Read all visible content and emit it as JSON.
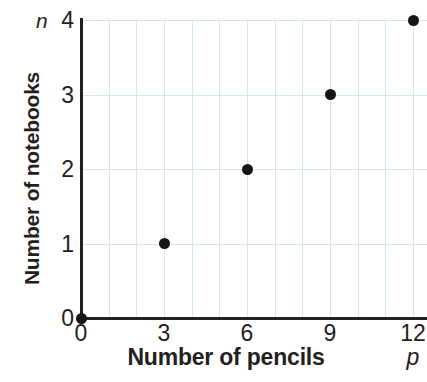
{
  "chart_data": {
    "type": "scatter",
    "title": "",
    "xlabel": "Number of pencils",
    "ylabel": "Number of notebooks",
    "x_variable": "p",
    "y_variable": "n",
    "x": [
      0,
      3,
      6,
      9,
      12
    ],
    "values": [
      0,
      1,
      2,
      3,
      4
    ],
    "points": [
      {
        "x": 0,
        "y": 0
      },
      {
        "x": 3,
        "y": 1
      },
      {
        "x": 6,
        "y": 2
      },
      {
        "x": 9,
        "y": 3
      },
      {
        "x": 12,
        "y": 4
      }
    ],
    "xlim": [
      0,
      12.5
    ],
    "ylim": [
      0,
      4
    ],
    "x_tick_labels": [
      "0",
      "3",
      "6",
      "9",
      "12"
    ],
    "x_tick_values": [
      0,
      3,
      6,
      9,
      12
    ],
    "y_tick_labels": [
      "0",
      "1",
      "2",
      "3",
      "4"
    ],
    "y_tick_values": [
      0,
      1,
      2,
      3,
      4
    ],
    "x_minor_step": 1,
    "y_minor_step": 1,
    "grid": true,
    "grid_color": "#cfeaf2",
    "point_color": "#151515",
    "axis_color": "#231f20",
    "legend": null,
    "legend_position": "none",
    "annotations": []
  }
}
